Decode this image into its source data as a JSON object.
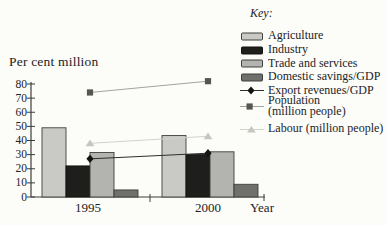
{
  "figure": {
    "key_title": "Key:"
  },
  "chart_data": {
    "type": "bar+line",
    "title": "",
    "ylabel": "Per cent million",
    "xlabel": "Year",
    "categories": [
      "1995",
      "2000"
    ],
    "ylim": [
      0,
      80
    ],
    "yticks": [
      0,
      10,
      20,
      30,
      40,
      50,
      60,
      70,
      80
    ],
    "grid": false,
    "legend_position": "top-right",
    "bar_series": [
      {
        "name": "Agriculture",
        "values": [
          49,
          43.5
        ],
        "color": "#c9c9c5",
        "border": "#3f3f3b"
      },
      {
        "name": "Industry",
        "values": [
          22,
          30
        ],
        "color": "#1e1e1c",
        "border": "#121210"
      },
      {
        "name": "Trade and services",
        "values": [
          31.5,
          32
        ],
        "color": "#b3b3af",
        "border": "#3f3f3b"
      },
      {
        "name": "Domestic savings/GDP",
        "values": [
          5,
          9
        ],
        "color": "#6f6f6b",
        "border": "#3f3f3b"
      }
    ],
    "line_series": [
      {
        "name": "Export revenues/GDP",
        "legend_lines": [
          "Export revenues/GDP"
        ],
        "values": [
          27,
          31
        ],
        "marker": "diamond",
        "line_color": "#2e2e2a",
        "marker_color": "#141412"
      },
      {
        "name": "Population (million people)",
        "legend_lines": [
          "Population",
          "(million people)"
        ],
        "values": [
          74,
          82
        ],
        "marker": "square",
        "line_color": "#a3a39e",
        "marker_color": "#565651"
      },
      {
        "name": "Labour (million people)",
        "legend_lines": [
          "Labour (million people)"
        ],
        "values": [
          38,
          43
        ],
        "marker": "triangle",
        "line_color": "#d2d2cd",
        "marker_color": "#c6c6c1"
      }
    ]
  }
}
